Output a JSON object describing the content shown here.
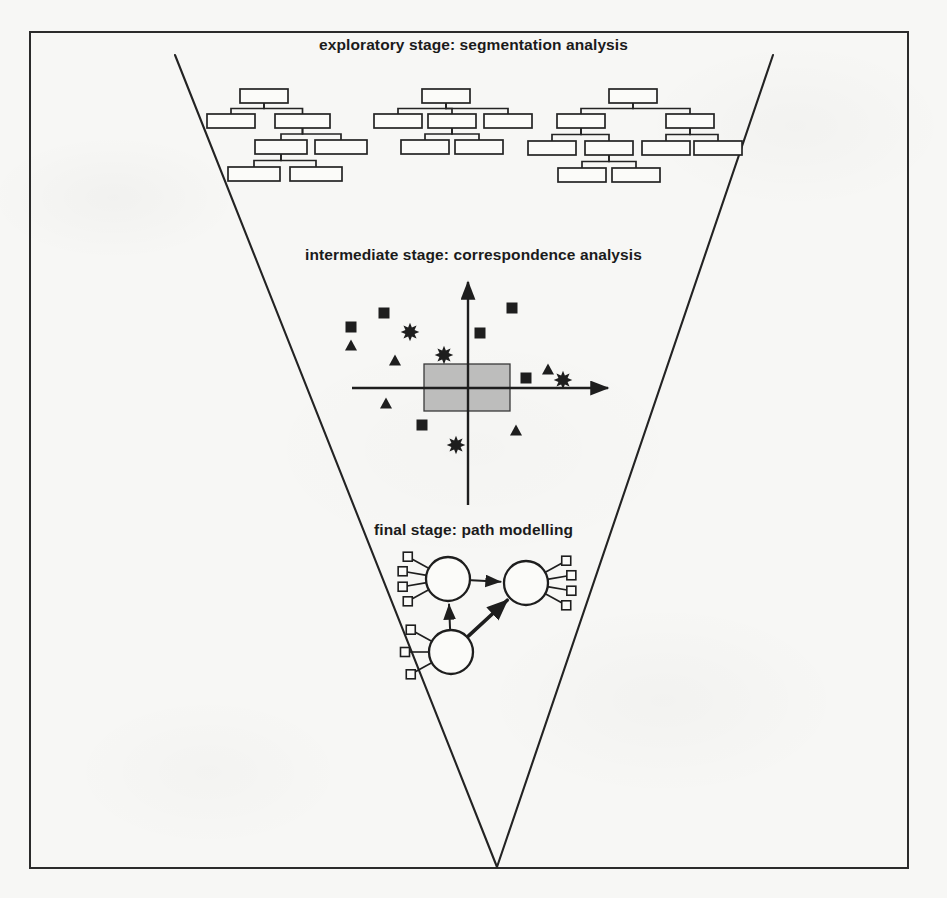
{
  "figure": {
    "background_color": "#f7f7f5",
    "ink_color": "#1e1e1e",
    "frame": {
      "x": 29,
      "y": 31,
      "width": 880,
      "height": 838,
      "border_width": 2
    }
  },
  "labels": {
    "exploratory": "exploratory stage: segmentation analysis",
    "intermediate": "intermediate stage: correspondence analysis",
    "final": "final stage: path modelling"
  },
  "funnel": {
    "left_line": {
      "x1": 175,
      "y1": 55,
      "x2": 497,
      "y2": 867
    },
    "right_line": {
      "x1": 773,
      "y1": 55,
      "x2": 497,
      "y2": 867
    },
    "apex": {
      "x": 497,
      "y": 867
    }
  },
  "trees": [
    {
      "name": "segmentation-tree-1",
      "boxes": [
        {
          "id": "t1-root",
          "x": 240,
          "y": 89,
          "w": 48,
          "h": 14
        },
        {
          "id": "t1-a",
          "x": 207,
          "y": 114,
          "w": 48,
          "h": 14
        },
        {
          "id": "t1-b",
          "x": 275,
          "y": 114,
          "w": 55,
          "h": 14
        },
        {
          "id": "t1-c",
          "x": 255,
          "y": 140,
          "w": 52,
          "h": 14
        },
        {
          "id": "t1-d",
          "x": 315,
          "y": 140,
          "w": 52,
          "h": 14
        },
        {
          "id": "t1-e",
          "x": 228,
          "y": 167,
          "w": 52,
          "h": 14
        },
        {
          "id": "t1-f",
          "x": 290,
          "y": 167,
          "w": 52,
          "h": 14
        }
      ],
      "links": [
        {
          "parent": "t1-root",
          "child": "t1-a"
        },
        {
          "parent": "t1-root",
          "child": "t1-b"
        },
        {
          "parent": "t1-b",
          "child": "t1-c"
        },
        {
          "parent": "t1-b",
          "child": "t1-d"
        },
        {
          "parent": "t1-c",
          "child": "t1-e"
        },
        {
          "parent": "t1-c",
          "child": "t1-f"
        }
      ]
    },
    {
      "name": "segmentation-tree-2",
      "boxes": [
        {
          "id": "t2-root",
          "x": 422,
          "y": 89,
          "w": 48,
          "h": 14
        },
        {
          "id": "t2-a",
          "x": 374,
          "y": 114,
          "w": 48,
          "h": 14
        },
        {
          "id": "t2-b",
          "x": 428,
          "y": 114,
          "w": 48,
          "h": 14
        },
        {
          "id": "t2-c",
          "x": 484,
          "y": 114,
          "w": 48,
          "h": 14
        },
        {
          "id": "t2-d",
          "x": 401,
          "y": 140,
          "w": 48,
          "h": 14
        },
        {
          "id": "t2-e",
          "x": 455,
          "y": 140,
          "w": 48,
          "h": 14
        }
      ],
      "links": [
        {
          "parent": "t2-root",
          "child": "t2-a"
        },
        {
          "parent": "t2-root",
          "child": "t2-b"
        },
        {
          "parent": "t2-root",
          "child": "t2-c"
        },
        {
          "parent": "t2-b",
          "child": "t2-d"
        },
        {
          "parent": "t2-b",
          "child": "t2-e"
        }
      ]
    },
    {
      "name": "segmentation-tree-3",
      "boxes": [
        {
          "id": "t3-root",
          "x": 609,
          "y": 89,
          "w": 48,
          "h": 14
        },
        {
          "id": "t3-a",
          "x": 557,
          "y": 114,
          "w": 48,
          "h": 14
        },
        {
          "id": "t3-b",
          "x": 666,
          "y": 114,
          "w": 48,
          "h": 14
        },
        {
          "id": "t3-c",
          "x": 528,
          "y": 141,
          "w": 48,
          "h": 14
        },
        {
          "id": "t3-d",
          "x": 585,
          "y": 141,
          "w": 48,
          "h": 14
        },
        {
          "id": "t3-e",
          "x": 642,
          "y": 141,
          "w": 48,
          "h": 14
        },
        {
          "id": "t3-f",
          "x": 694,
          "y": 141,
          "w": 48,
          "h": 14
        },
        {
          "id": "t3-g",
          "x": 558,
          "y": 168,
          "w": 48,
          "h": 14
        },
        {
          "id": "t3-h",
          "x": 612,
          "y": 168,
          "w": 48,
          "h": 14
        }
      ],
      "links": [
        {
          "parent": "t3-root",
          "child": "t3-a"
        },
        {
          "parent": "t3-root",
          "child": "t3-b"
        },
        {
          "parent": "t3-a",
          "child": "t3-c"
        },
        {
          "parent": "t3-a",
          "child": "t3-d"
        },
        {
          "parent": "t3-b",
          "child": "t3-e"
        },
        {
          "parent": "t3-b",
          "child": "t3-f"
        },
        {
          "parent": "t3-d",
          "child": "t3-g"
        },
        {
          "parent": "t3-d",
          "child": "t3-h"
        }
      ]
    }
  ],
  "chart_data": {
    "type": "scatter",
    "title": "intermediate stage: correspondence analysis",
    "xlabel": "",
    "ylabel": "",
    "grid": false,
    "legend_position": "none",
    "axes": {
      "origin_px": {
        "x": 468,
        "y": 388
      },
      "horizontal_px": {
        "x1": 352,
        "x2": 608,
        "y": 388,
        "arrow": "right"
      },
      "vertical_px": {
        "y1": 282,
        "y2": 505,
        "x": 468,
        "arrow": "up"
      }
    },
    "highlight_rect": {
      "label": "central cluster region",
      "x": 424,
      "y": 364,
      "w": 86,
      "h": 47,
      "color": "#8e8e8e"
    },
    "series": [
      {
        "name": "squares",
        "marker": "square",
        "points_px": [
          {
            "x": 351,
            "y": 327
          },
          {
            "x": 384,
            "y": 313
          },
          {
            "x": 512,
            "y": 308
          },
          {
            "x": 480,
            "y": 333
          },
          {
            "x": 526,
            "y": 378
          },
          {
            "x": 422,
            "y": 425
          }
        ]
      },
      {
        "name": "triangles",
        "marker": "triangle",
        "points_px": [
          {
            "x": 351,
            "y": 345
          },
          {
            "x": 395,
            "y": 360
          },
          {
            "x": 386,
            "y": 403
          },
          {
            "x": 548,
            "y": 369
          },
          {
            "x": 516,
            "y": 430
          }
        ]
      },
      {
        "name": "stars",
        "marker": "star",
        "points_px": [
          {
            "x": 410,
            "y": 332
          },
          {
            "x": 444,
            "y": 355
          },
          {
            "x": 563,
            "y": 380
          },
          {
            "x": 456,
            "y": 445
          }
        ]
      }
    ]
  },
  "path_model": {
    "name": "final-stage-path-model",
    "latent_variables": [
      {
        "id": "lv-left",
        "cx": 448,
        "cy": 579,
        "r": 22,
        "indicator_side": "left",
        "indicator_count": 4
      },
      {
        "id": "lv-right",
        "cx": 526,
        "cy": 583,
        "r": 22,
        "indicator_side": "right",
        "indicator_count": 4
      },
      {
        "id": "lv-bottom",
        "cx": 451,
        "cy": 652,
        "r": 22,
        "indicator_side": "left",
        "indicator_count": 3
      }
    ],
    "paths": [
      {
        "from": "lv-left",
        "to": "lv-right",
        "weight": "thin"
      },
      {
        "from": "lv-bottom",
        "to": "lv-left",
        "weight": "thin"
      },
      {
        "from": "lv-bottom",
        "to": "lv-right",
        "weight": "thick"
      }
    ],
    "indicator_shape": "square"
  }
}
